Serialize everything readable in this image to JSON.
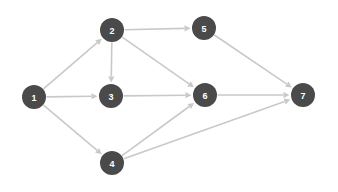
{
  "chart_data": {
    "type": "diagram",
    "title": "",
    "subtitle": "",
    "xlabel": "",
    "ylabel": "",
    "layout": {
      "width": 338,
      "height": 192,
      "background_color": "#ffffff",
      "node_radius": 12,
      "node_fill_color": "#4a4a4a",
      "node_label_color": "#ffffff",
      "edge_color": "#c9c9c9",
      "edge_width": 1.6,
      "arrow_color": "#c9c9c9",
      "arrow_size": 6,
      "directed": true,
      "grid": false,
      "legend": "none"
    },
    "nodes": [
      {
        "id": "1",
        "label": "1",
        "x": 34,
        "y": 97
      },
      {
        "id": "2",
        "label": "2",
        "x": 112,
        "y": 30
      },
      {
        "id": "3",
        "label": "3",
        "x": 111,
        "y": 96
      },
      {
        "id": "4",
        "label": "4",
        "x": 112,
        "y": 163
      },
      {
        "id": "5",
        "label": "5",
        "x": 204,
        "y": 28
      },
      {
        "id": "6",
        "label": "6",
        "x": 205,
        "y": 95
      },
      {
        "id": "7",
        "label": "7",
        "x": 303,
        "y": 95
      }
    ],
    "edges": [
      {
        "from": "1",
        "to": "2"
      },
      {
        "from": "1",
        "to": "3"
      },
      {
        "from": "1",
        "to": "4"
      },
      {
        "from": "2",
        "to": "3"
      },
      {
        "from": "2",
        "to": "5"
      },
      {
        "from": "2",
        "to": "6"
      },
      {
        "from": "3",
        "to": "6"
      },
      {
        "from": "4",
        "to": "6"
      },
      {
        "from": "4",
        "to": "7"
      },
      {
        "from": "5",
        "to": "7"
      },
      {
        "from": "6",
        "to": "7"
      }
    ],
    "node_count": 7,
    "edge_count": 11
  }
}
